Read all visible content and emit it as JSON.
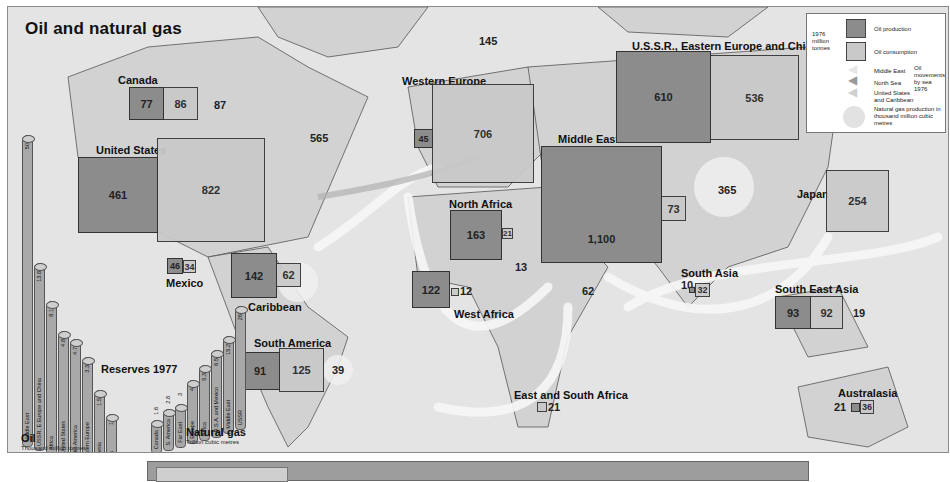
{
  "title": "Oil and natural gas",
  "legend": {
    "year_units": "1976 million tonnes",
    "oil_production": "Oil production",
    "oil_consumption": "Oil consumption",
    "movements_title": "Oil movements by sea 1976",
    "movement_middle_east": "Middle East",
    "movement_north_sea": "North Sea",
    "movement_us_caribbean": "United States and Caribbean",
    "gas_production": "Natural gas production in thousand million cubic metres",
    "colors": {
      "production": "#8c8c8c",
      "consumption": "#c9c9c9",
      "background": "#e4e4e4",
      "gas_circle": "#f0f0f0"
    }
  },
  "regions": [
    {
      "name": "Canada",
      "production": "77",
      "consumption": "86",
      "gas": "87"
    },
    {
      "name": "United States",
      "production": "461",
      "consumption": "822",
      "gas": "565"
    },
    {
      "name": "Mexico",
      "production": "46",
      "consumption": "34"
    },
    {
      "name": "Caribbean",
      "production": "142",
      "consumption": "62"
    },
    {
      "name": "South America",
      "production": "91",
      "consumption": "125",
      "gas": "39"
    },
    {
      "name": "Western Europe",
      "production": "45",
      "consumption": "706",
      "gas": "145"
    },
    {
      "name": "North Africa",
      "production": "163",
      "consumption": "21",
      "gas": "13"
    },
    {
      "name": "West Africa",
      "production": "122",
      "consumption": "12"
    },
    {
      "name": "Middle East",
      "production": "1,100",
      "consumption": "73",
      "gas": "62"
    },
    {
      "name": "East and South Africa",
      "consumption": "21"
    },
    {
      "name": "U.S.S.R., Eastern Europe and China",
      "production": "610",
      "consumption": "536",
      "gas": "365"
    },
    {
      "name": "South Asia",
      "production": "10",
      "consumption": "32"
    },
    {
      "name": "Japan",
      "production": "1",
      "consumption": "254"
    },
    {
      "name": "South East Asia",
      "production": "93",
      "consumption": "92",
      "gas": "19"
    },
    {
      "name": "Australasia",
      "production": "21",
      "consumption": "36"
    }
  ],
  "reserves": {
    "title": "Reserves 1977",
    "oil": {
      "title": "Oil",
      "units": "Thousand million tonnes",
      "bars": [
        {
          "label": "Middle East",
          "value": "50"
        },
        {
          "label": "USSR, E.Europe and China",
          "value": "13.8"
        },
        {
          "label": "Africa",
          "value": "8.1"
        },
        {
          "label": "United States",
          "value": "4.8"
        },
        {
          "label": "Latin America",
          "value": "4.7"
        },
        {
          "label": "Western Europe",
          "value": "3.3"
        },
        {
          "label": "Indonesia",
          "value": "1.5"
        },
        {
          "label": "Canada",
          "value": "1"
        }
      ]
    },
    "gas": {
      "title": "Natural gas",
      "units": "Trillion cubic metres",
      "bars": [
        {
          "label": "Canada",
          "value": "1.6"
        },
        {
          "label": "S. America",
          "value": "2.8"
        },
        {
          "label": "Far East",
          "value": "3"
        },
        {
          "label": "Europe",
          "value": "4"
        },
        {
          "label": "Africa",
          "value": "5.3"
        },
        {
          "label": "U.S.A. and Mexico",
          "value": "6.5"
        },
        {
          "label": "Middle East",
          "value": "15.2"
        },
        {
          "label": "USSR",
          "value": "26"
        }
      ]
    }
  }
}
